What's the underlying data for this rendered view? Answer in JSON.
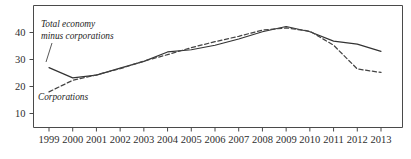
{
  "chart_data": {
    "type": "line",
    "title": "",
    "xlabel": "",
    "ylabel": "",
    "xlim": [
      1999,
      2013
    ],
    "ylim": [
      0,
      46
    ],
    "yticks": [
      10,
      20,
      30,
      40
    ],
    "ytick_labels": [
      "10",
      "20",
      "30",
      "40"
    ],
    "grid": false,
    "legend_position": "inline-annotations",
    "categories": [
      1999,
      2000,
      2001,
      2002,
      2003,
      2004,
      2005,
      2006,
      2007,
      2008,
      2009,
      2010,
      2011,
      2012,
      2013
    ],
    "xtick_labels": [
      "1999",
      "2000",
      "2001",
      "2002",
      "2003",
      "2004",
      "2005",
      "2006",
      "2007",
      "2008",
      "2009",
      "2010",
      "2011",
      "2012",
      "2013"
    ],
    "series": [
      {
        "name": "Total economy minus corporations",
        "style": "solid",
        "color": "#333333",
        "values": [
          27.0,
          23.2,
          24.2,
          26.8,
          29.3,
          32.8,
          33.6,
          35.3,
          37.6,
          40.3,
          42.2,
          40.3,
          36.8,
          35.7,
          33.0
        ]
      },
      {
        "name": "Corporations",
        "style": "dashed",
        "color": "#444444",
        "values": [
          18.0,
          22.3,
          24.3,
          26.6,
          29.4,
          31.8,
          34.4,
          36.6,
          38.6,
          40.9,
          41.7,
          40.5,
          35.3,
          26.5,
          25.2
        ]
      }
    ],
    "annotations": [
      {
        "text_line1": "Total economy",
        "text_line2": "minus corporations",
        "target_series": "Total economy minus corporations"
      },
      {
        "text_line1": "Corporations",
        "text_line2": "",
        "target_series": "Corporations"
      }
    ]
  }
}
